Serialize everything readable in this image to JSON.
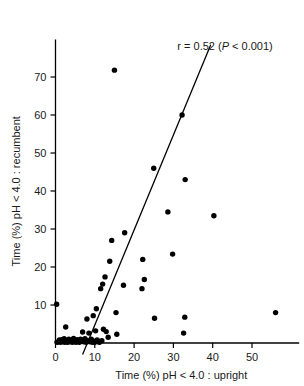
{
  "chart_data": {
    "type": "scatter",
    "title": "",
    "xlabel": "Time (%) pH < 4.0 : upright",
    "ylabel": "Time (%) pH < 4.0 : recumbent",
    "xlim": [
      0,
      62
    ],
    "ylim": [
      0,
      78
    ],
    "xticks": [
      0,
      10,
      20,
      30,
      40,
      50
    ],
    "xtick_labels": [
      "0",
      "10",
      "20",
      "30",
      "40",
      "50"
    ],
    "yticks": [
      10,
      20,
      30,
      40,
      50,
      60,
      70
    ],
    "ytick_labels": [
      "10",
      "20",
      "30",
      "40",
      "50",
      "60",
      "70"
    ],
    "grid": false,
    "legend": null,
    "annotations": [
      {
        "name": "correlation-annotation",
        "text_prefix": "r = 0.52 (",
        "text_italic": "P",
        "text_suffix": " < 0.001)",
        "x": 31,
        "y": 77
      }
    ],
    "series": [
      {
        "name": "subjects",
        "marker": "filled-circle",
        "color": "#000000",
        "points": [
          [
            0.3,
            10.2
          ],
          [
            0.4,
            0.2
          ],
          [
            0.8,
            0.3
          ],
          [
            1.0,
            0.8
          ],
          [
            1.3,
            0.2
          ],
          [
            1.6,
            0.9
          ],
          [
            1.9,
            0.3
          ],
          [
            2.2,
            1.1
          ],
          [
            2.4,
            0.2
          ],
          [
            2.6,
            4.2
          ],
          [
            2.8,
            0.6
          ],
          [
            3.1,
            0.2
          ],
          [
            3.4,
            1.0
          ],
          [
            3.7,
            0.3
          ],
          [
            4.0,
            0.7
          ],
          [
            4.3,
            0.2
          ],
          [
            4.6,
            1.2
          ],
          [
            4.9,
            0.4
          ],
          [
            5.2,
            0.2
          ],
          [
            5.5,
            0.9
          ],
          [
            5.8,
            0.3
          ],
          [
            6.1,
            0.2
          ],
          [
            6.4,
            1.0
          ],
          [
            6.6,
            0.5
          ],
          [
            6.9,
            2.9
          ],
          [
            7.2,
            0.3
          ],
          [
            7.5,
            1.1
          ],
          [
            7.8,
            0.2
          ],
          [
            8.0,
            6.3
          ],
          [
            8.2,
            0.6
          ],
          [
            8.5,
            2.6
          ],
          [
            8.8,
            0.3
          ],
          [
            9.1,
            1.0
          ],
          [
            9.4,
            0.2
          ],
          [
            9.6,
            7.2
          ],
          [
            9.8,
            0.5
          ],
          [
            10.0,
            0.2
          ],
          [
            10.2,
            3.2
          ],
          [
            10.4,
            9.0
          ],
          [
            10.6,
            0.8
          ],
          [
            10.9,
            0.3
          ],
          [
            11.2,
            0.2
          ],
          [
            11.5,
            14.3
          ],
          [
            11.8,
            0.6
          ],
          [
            12.2,
            3.6
          ],
          [
            12.6,
            17.4
          ],
          [
            12.9,
            3.0
          ],
          [
            12.0,
            15.5
          ],
          [
            13.4,
            1.5
          ],
          [
            13.8,
            21.5
          ],
          [
            14.3,
            27.0
          ],
          [
            15.0,
            71.8
          ],
          [
            15.4,
            8.0
          ],
          [
            15.6,
            2.3
          ],
          [
            17.3,
            15.2
          ],
          [
            17.6,
            29.0
          ],
          [
            22.0,
            14.3
          ],
          [
            22.2,
            22.0
          ],
          [
            22.6,
            16.7
          ],
          [
            25.0,
            46.0
          ],
          [
            25.2,
            6.5
          ],
          [
            28.6,
            34.5
          ],
          [
            29.8,
            23.4
          ],
          [
            32.2,
            60.0
          ],
          [
            32.6,
            2.6
          ],
          [
            32.9,
            6.8
          ],
          [
            33.0,
            43.0
          ],
          [
            40.3,
            33.5
          ],
          [
            56.0,
            8.0
          ]
        ]
      }
    ],
    "fit_line": {
      "name": "regression-line",
      "color": "#000000",
      "x_start": 6.9,
      "y_start": -3.0,
      "x_end": 39.5,
      "y_end": 78.5
    }
  }
}
